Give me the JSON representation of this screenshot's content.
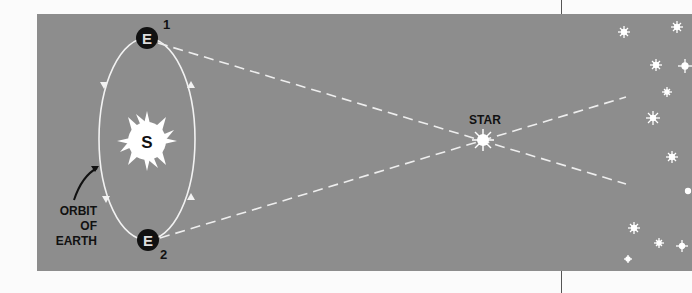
{
  "diagram": {
    "type": "stellar-parallax",
    "labels": {
      "earth_1": "E",
      "earth_1_index": "1",
      "earth_2": "E",
      "earth_2_index": "2",
      "sun": "S",
      "star": "STAR",
      "orbit_line1": "ORBIT",
      "orbit_line2": "OF",
      "orbit_line3": "EARTH"
    },
    "colors": {
      "panel": "#8d8d8d",
      "lines": "#f2f2f2",
      "earth": "#111111",
      "text": "#111111"
    }
  }
}
